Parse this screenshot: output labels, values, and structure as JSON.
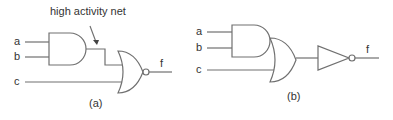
{
  "diagram": {
    "type": "logic-circuit",
    "colors": {
      "line": "#707070",
      "text": "#333333",
      "background": "#ffffff"
    },
    "panel_a": {
      "caption": "(a)",
      "inputs": [
        "a",
        "b",
        "c"
      ],
      "output": "f",
      "annotation": "high activity net",
      "gates": [
        "AND(a,b)",
        "NOR(AND, c)"
      ]
    },
    "panel_b": {
      "caption": "(b)",
      "inputs": [
        "a",
        "b",
        "c"
      ],
      "output": "f",
      "gates": [
        "AND(a,b)",
        "OR(AND, c)",
        "INVERTER"
      ]
    }
  }
}
